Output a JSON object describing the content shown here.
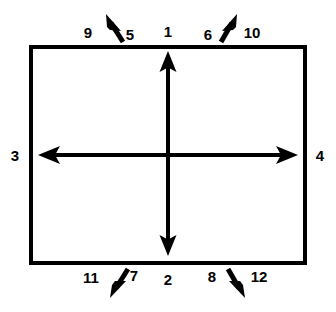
{
  "figure": {
    "background_color": "#ffffff",
    "stroke_color": "#000000",
    "box": {
      "name": "outer-rectangle",
      "x": 29,
      "y": 45,
      "width": 278,
      "height": 220,
      "stroke_width": 4
    },
    "center": {
      "x": 168,
      "y": 155
    },
    "axis_arrows": [
      {
        "id": "axis-up",
        "label": "1",
        "direction": "up",
        "label_x": 168,
        "label_y": 31,
        "tail_x": 168,
        "tail_y": 250,
        "tip_x": 168,
        "tip_y": 57
      },
      {
        "id": "axis-down",
        "label": "2",
        "direction": "down",
        "label_x": 168,
        "label_y": 279,
        "tail_x": 168,
        "tail_y": 57,
        "tip_x": 168,
        "tip_y": 250
      },
      {
        "id": "axis-left",
        "label": "3",
        "direction": "left",
        "label_x": 15,
        "label_y": 155,
        "tail_x": 292,
        "tail_y": 155,
        "tip_x": 44,
        "tip_y": 155
      },
      {
        "id": "axis-right",
        "label": "4",
        "direction": "right",
        "label_x": 320,
        "label_y": 155,
        "tail_x": 44,
        "tail_y": 155,
        "tip_x": 292,
        "tip_y": 155
      }
    ],
    "diagonal_arrows": [
      {
        "id": "diag-up-left-outer",
        "direction": "up-left",
        "label": "9",
        "label_x": 88,
        "label_y": 32,
        "tail_x": 124,
        "tail_y": 43,
        "tip_x": 108,
        "tip_y": 17
      },
      {
        "id": "diag-up-left-inner",
        "direction": "up-left",
        "label": "5",
        "label_x": 130,
        "label_y": 34,
        "tail_x": 124,
        "tail_y": 43,
        "tip_x": 108,
        "tip_y": 17
      },
      {
        "id": "diag-up-right-inner",
        "direction": "up-right",
        "label": "6",
        "label_x": 208,
        "label_y": 34,
        "tail_x": 214,
        "tail_y": 43,
        "tip_x": 233,
        "tip_y": 17
      },
      {
        "id": "diag-up-right-outer",
        "direction": "up-right",
        "label": "10",
        "label_x": 252,
        "label_y": 32,
        "tail_x": 214,
        "tail_y": 43,
        "tip_x": 233,
        "tip_y": 17
      },
      {
        "id": "diag-down-left-outer",
        "direction": "down-left",
        "label": "11",
        "label_x": 91,
        "label_y": 277,
        "tail_x": 128,
        "tail_y": 268,
        "tip_x": 110,
        "tip_y": 296
      },
      {
        "id": "diag-down-left-inner",
        "direction": "down-left",
        "label": "7",
        "label_x": 134,
        "label_y": 275,
        "tail_x": 128,
        "tail_y": 268,
        "tip_x": 110,
        "tip_y": 296
      },
      {
        "id": "diag-down-right-inner",
        "direction": "down-right",
        "label": "8",
        "label_x": 212,
        "label_y": 276,
        "tail_x": 222,
        "tail_y": 268,
        "tip_x": 240,
        "tip_y": 296
      },
      {
        "id": "diag-down-right-outer",
        "direction": "down-right",
        "label": "12",
        "label_x": 259,
        "label_y": 276,
        "tail_x": 222,
        "tail_y": 268,
        "tip_x": 240,
        "tip_y": 296
      }
    ]
  }
}
